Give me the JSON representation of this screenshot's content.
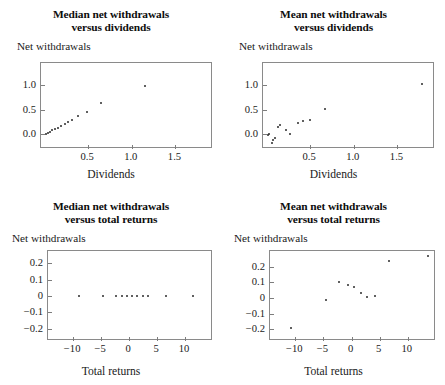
{
  "figure": {
    "background": "#ffffff",
    "axis_color": "#8a8a8a",
    "marker_color": "#2b2b2b",
    "shared_ylabel": "Net withdrawals"
  },
  "panels": [
    {
      "id": "median-vs-dividends",
      "title_line1": "Median net withdrawals",
      "title_line2": "versus dividends",
      "ylabel": "Net withdrawals",
      "xlabel": "Dividends",
      "xticks": [
        "0.5",
        "1.0",
        "1.5"
      ],
      "xtick_values": [
        0.5,
        1.0,
        1.5
      ],
      "yticks": [
        "1.0",
        "0.5",
        "0.0"
      ],
      "ytick_values": [
        1.0,
        0.5,
        0.0
      ]
    },
    {
      "id": "mean-vs-dividends",
      "title_line1": "Mean net withdrawals",
      "title_line2": "versus dividends",
      "ylabel": "Net withdrawals",
      "xlabel": "Dividends",
      "xticks": [
        "0.5",
        "1.0",
        "1.5"
      ],
      "xtick_values": [
        0.5,
        1.0,
        1.5
      ],
      "yticks": [
        "1.0",
        "0.5",
        "0.0"
      ],
      "ytick_values": [
        1.0,
        0.5,
        0.0
      ]
    },
    {
      "id": "median-vs-total-returns",
      "title_line1": "Median net withdrawals",
      "title_line2": "versus total returns",
      "ylabel": "Net withdrawals",
      "xlabel": "Total returns",
      "xticks": [
        "−10",
        "−5",
        "0",
        "5",
        "10"
      ],
      "xtick_values": [
        -10,
        -5,
        0,
        5,
        10
      ],
      "yticks": [
        "0.2",
        "0.1",
        "0",
        "−0.1",
        "−0.2"
      ],
      "ytick_values": [
        0.2,
        0.1,
        0,
        -0.1,
        -0.2
      ]
    },
    {
      "id": "mean-vs-total-returns",
      "title_line1": "Mean net withdrawals",
      "title_line2": "versus total returns",
      "ylabel": "Net withdrawals",
      "xlabel": "Total returns",
      "xticks": [
        "−10",
        "−5",
        "0",
        "5",
        "10"
      ],
      "xtick_values": [
        -10,
        -5,
        0,
        5,
        10
      ],
      "yticks": [
        "0.2",
        "0.1",
        "0",
        "−0.1",
        "−0.2"
      ],
      "ytick_values": [
        0.2,
        0.1,
        0,
        -0.1,
        -0.2
      ]
    }
  ],
  "chart_data": [
    {
      "type": "scatter",
      "id": "median-vs-dividends",
      "title": "Median net withdrawals versus dividends",
      "xlabel": "Dividends",
      "ylabel": "Net withdrawals",
      "xlim": [
        -0.04,
        1.93
      ],
      "ylim": [
        -0.3,
        1.45
      ],
      "grid": false,
      "legend": "none",
      "x": [
        0.02,
        0.04,
        0.06,
        0.09,
        0.12,
        0.15,
        0.19,
        0.23,
        0.27,
        0.32,
        0.38,
        0.49,
        0.65,
        1.15
      ],
      "y": [
        0.01,
        0.03,
        0.05,
        0.08,
        0.1,
        0.13,
        0.16,
        0.2,
        0.25,
        0.3,
        0.37,
        0.46,
        0.63,
        0.98
      ]
    },
    {
      "type": "scatter",
      "id": "mean-vs-dividends",
      "title": "Mean net withdrawals versus dividends",
      "xlabel": "Dividends",
      "ylabel": "Net withdrawals",
      "xlim": [
        -0.04,
        1.93
      ],
      "ylim": [
        -0.3,
        1.45
      ],
      "grid": false,
      "legend": "none",
      "x": [
        0.02,
        0.03,
        0.06,
        0.08,
        0.1,
        0.13,
        0.16,
        0.22,
        0.27,
        0.36,
        0.42,
        0.5,
        0.67,
        1.78
      ],
      "y": [
        -0.01,
        0.01,
        -0.18,
        -0.12,
        -0.07,
        0.14,
        0.19,
        0.08,
        0.01,
        0.23,
        0.26,
        0.29,
        0.52,
        1.03
      ]
    },
    {
      "type": "scatter",
      "id": "median-vs-total-returns",
      "title": "Median net withdrawals versus total returns",
      "xlabel": "Total returns",
      "ylabel": "Net withdrawals",
      "xlim": [
        -14.5,
        15.0
      ],
      "ylim": [
        -0.275,
        0.275
      ],
      "grid": false,
      "legend": "none",
      "x": [
        -9.0,
        -4.6,
        -2.4,
        -1.2,
        -0.3,
        0.6,
        1.5,
        2.4,
        3.4,
        6.6,
        11.4
      ],
      "y": [
        0,
        0,
        0,
        0,
        0,
        0,
        0,
        0,
        0,
        0,
        0
      ]
    },
    {
      "type": "scatter",
      "id": "mean-vs-total-returns",
      "title": "Mean net withdrawals versus total returns",
      "xlabel": "Total returns",
      "ylabel": "Net withdrawals",
      "xlim": [
        -14.5,
        15.0
      ],
      "ylim": [
        -0.275,
        0.3
      ],
      "grid": false,
      "legend": "none",
      "x": [
        -10.8,
        -4.6,
        -2.3,
        -0.7,
        0.5,
        1.6,
        2.7,
        4.2,
        6.6,
        13.5
      ],
      "y": [
        -0.195,
        -0.012,
        0.104,
        0.082,
        0.073,
        0.031,
        0.005,
        0.012,
        0.238,
        0.268
      ]
    }
  ]
}
